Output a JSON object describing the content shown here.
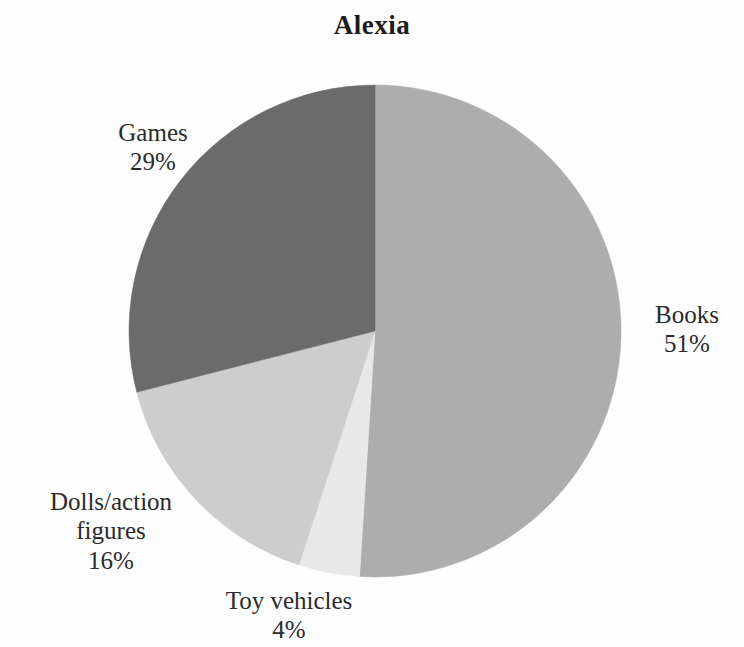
{
  "chart_data": {
    "type": "pie",
    "title": "Alexia",
    "categories": [
      "Books",
      "Toy vehicles",
      "Dolls/action figures",
      "Games"
    ],
    "values": [
      51,
      4,
      16,
      29
    ],
    "value_unit": "%",
    "start_angle_deg": 0,
    "direction": "clockwise",
    "legend": "none",
    "labels_position": "outside",
    "colors": [
      "#adadad",
      "#e8e8e8",
      "#cdcdcd",
      "#6b6b6b"
    ],
    "slices": [
      {
        "name": "Books",
        "value": 51,
        "label_lines": [
          "Books",
          "51%"
        ],
        "color": "#adadad"
      },
      {
        "name": "Toy vehicles",
        "value": 4,
        "label_lines": [
          "Toy vehicles",
          "4%"
        ],
        "color": "#e8e8e8"
      },
      {
        "name": "Dolls/action figures",
        "value": 16,
        "label_lines": [
          "Dolls/action",
          "figures",
          "16%"
        ],
        "color": "#cdcdcd"
      },
      {
        "name": "Games",
        "value": 29,
        "label_lines": [
          "Games",
          "29%"
        ],
        "color": "#6b6b6b"
      }
    ]
  },
  "title": "Alexia",
  "labels": {
    "games": {
      "l1": "Games",
      "l2": "29%"
    },
    "books": {
      "l1": "Books",
      "l2": "51%"
    },
    "dolls": {
      "l1": "Dolls/action",
      "l2": "figures",
      "l3": "16%"
    },
    "toys": {
      "l1": "Toy vehicles",
      "l2": "4%"
    }
  }
}
